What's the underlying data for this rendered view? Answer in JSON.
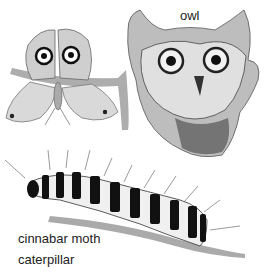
{
  "labels": {
    "owl": "owl",
    "caterpillar_line1": "cinnabar moth",
    "caterpillar_line2": "caterpillar"
  },
  "illustrations": [
    {
      "name": "moth",
      "description": "moth with owl-like eyespots on forewings, perched on a twig"
    },
    {
      "name": "owl",
      "description": "close-up of an owl face with large round eyes"
    },
    {
      "name": "caterpillar",
      "description": "black-and-white banded hairy caterpillar on a twig"
    }
  ],
  "colors": {
    "ink": "#222222",
    "mid_gray": "#888888",
    "light_gray": "#cccccc",
    "background": "#ffffff"
  }
}
